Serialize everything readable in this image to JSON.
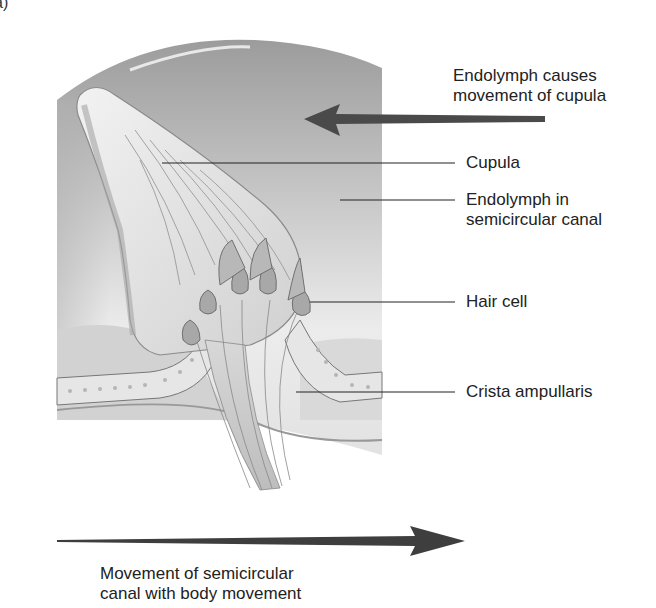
{
  "panel_label": "a)",
  "labels": {
    "endolymph_causes": [
      "Endolymph causes",
      "movement of cupula"
    ],
    "cupula": "Cupula",
    "endolymph_in": [
      "Endolymph in",
      "semicircular canal"
    ],
    "hair_cell": "Hair cell",
    "crista": "Crista ampullaris",
    "movement": [
      "Movement of semicircular",
      "canal with body movement"
    ]
  },
  "colors": {
    "arrow": "#4a4a4a",
    "leader_line": "#222222",
    "canal_dark": "#9a9a9a",
    "canal_light": "#e6e6e6",
    "cupula_fill": "#dcdcdc"
  }
}
